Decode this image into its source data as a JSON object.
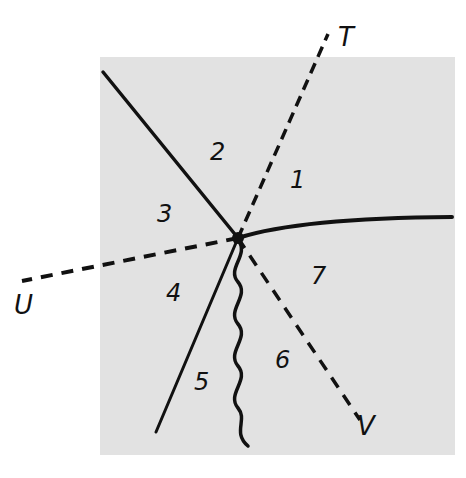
{
  "diagram": {
    "background_panel_color": "#e2e2e2",
    "line_color": "#111111",
    "axis_labels": {
      "T": "T",
      "U": "U",
      "V": "V"
    },
    "regions": [
      "1",
      "2",
      "3",
      "4",
      "5",
      "6",
      "7"
    ],
    "center_point": {
      "x": 238,
      "y": 238
    },
    "elements": [
      {
        "type": "dashed-line",
        "label": "T",
        "direction": "upper-right"
      },
      {
        "type": "dashed-line",
        "label": "U",
        "direction": "left"
      },
      {
        "type": "dashed-line",
        "label": "V",
        "direction": "lower-right"
      },
      {
        "type": "solid-line",
        "direction": "upper-left"
      },
      {
        "type": "solid-curve",
        "direction": "right"
      },
      {
        "type": "solid-line",
        "direction": "lower-left"
      },
      {
        "type": "wavy-line",
        "direction": "down"
      }
    ]
  }
}
